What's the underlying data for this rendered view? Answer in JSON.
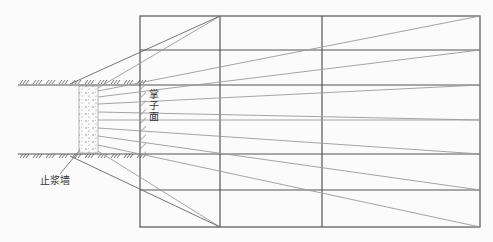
{
  "labels": {
    "face": "掌子面",
    "grout_wall": "止浆墙"
  },
  "colors": {
    "grid": "#555555",
    "fan": "#9a9a9a",
    "background": "#fbfbfb"
  },
  "fan_hole_count": 11
}
